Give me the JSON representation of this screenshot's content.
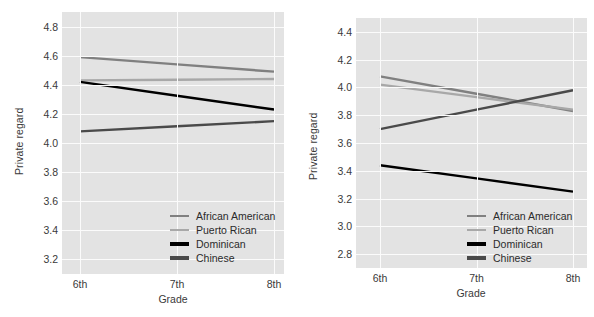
{
  "figure": {
    "panels": [
      "left",
      "right"
    ],
    "caption_fragment": ""
  },
  "colors": {
    "plot_background": "#e3e3e3",
    "grid": "#fbfbfb",
    "page_background": "#ffffff",
    "text": "#3a3a3a",
    "african_american": "#808080",
    "puerto_rican": "#a8a8a8",
    "dominican": "#000000",
    "chinese": "#4a4a4a"
  },
  "legend": {
    "entries": [
      {
        "label": "African American",
        "color": "#808080",
        "swatch": "line-swatch"
      },
      {
        "label": "Puerto Rican",
        "color": "#a8a8a8",
        "swatch": "line-swatch"
      },
      {
        "label": "Dominican",
        "color": "#000000",
        "swatch": "line-swatch"
      },
      {
        "label": "Chinese",
        "color": "#4a4a4a",
        "swatch": "line-swatch"
      }
    ]
  },
  "chart_data": [
    {
      "type": "line",
      "panel": "left",
      "title": "",
      "xlabel": "Grade",
      "ylabel": "Private regard",
      "categories": [
        "6th",
        "7th",
        "8th"
      ],
      "x": [
        0,
        1,
        2
      ],
      "ylim": [
        3.1,
        4.9
      ],
      "yticks": [
        3.2,
        3.4,
        3.6,
        3.8,
        4.0,
        4.2,
        4.4,
        4.6,
        4.8
      ],
      "ytick_labels": [
        "3.2",
        "3.4",
        "3.6",
        "3.8",
        "4.0",
        "4.2",
        "4.4",
        "4.6",
        "4.8"
      ],
      "grid": true,
      "legend_position": "lower-right",
      "series": [
        {
          "name": "African American",
          "color": "#808080",
          "values": [
            4.59,
            4.54,
            4.49
          ]
        },
        {
          "name": "Puerto Rican",
          "color": "#a8a8a8",
          "values": [
            4.43,
            4.435,
            4.44
          ]
        },
        {
          "name": "Dominican",
          "color": "#000000",
          "values": [
            4.42,
            4.325,
            4.23
          ]
        },
        {
          "name": "Chinese",
          "color": "#4a4a4a",
          "values": [
            4.08,
            4.115,
            4.15
          ]
        }
      ]
    },
    {
      "type": "line",
      "panel": "right",
      "title": "",
      "xlabel": "Grade",
      "ylabel": "Private regard",
      "categories": [
        "6th",
        "7th",
        "8th"
      ],
      "x": [
        0,
        1,
        2
      ],
      "ylim": [
        2.7,
        4.5
      ],
      "yticks": [
        2.8,
        3.0,
        3.2,
        3.4,
        3.6,
        3.8,
        4.0,
        4.2,
        4.4
      ],
      "ytick_labels": [
        "2.8",
        "3.0",
        "3.2",
        "3.4",
        "3.6",
        "3.8",
        "4.0",
        "4.2",
        "4.4"
      ],
      "grid": true,
      "legend_position": "lower-right",
      "series": [
        {
          "name": "African American",
          "color": "#808080",
          "values": [
            4.08,
            3.955,
            3.83
          ]
        },
        {
          "name": "Puerto Rican",
          "color": "#a8a8a8",
          "values": [
            4.02,
            3.93,
            3.84
          ]
        },
        {
          "name": "Dominican",
          "color": "#000000",
          "values": [
            3.44,
            3.345,
            3.25
          ]
        },
        {
          "name": "Chinese",
          "color": "#4a4a4a",
          "values": [
            3.7,
            3.84,
            3.98
          ]
        }
      ]
    }
  ]
}
